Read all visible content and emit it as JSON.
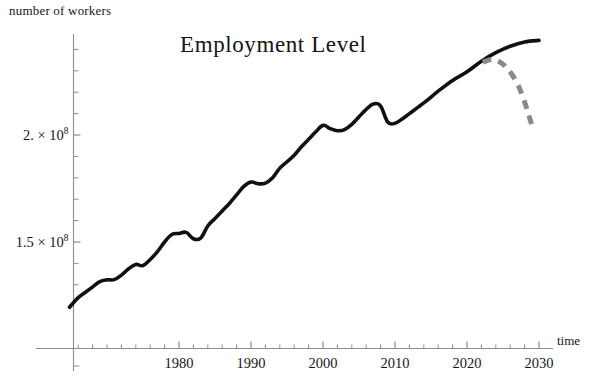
{
  "chart_data": {
    "type": "line",
    "title": "Employment  Level",
    "xlabel": "time",
    "ylabel": "number of workers",
    "xlim": [
      1964.8,
      2032
    ],
    "ylim": [
      121000000,
      248000000
    ],
    "grid": false,
    "legend": "none",
    "xticks": [
      1980,
      1990,
      2000,
      2010,
      2020,
      2030
    ],
    "xtick_labels": [
      "1980",
      "1990",
      "2000",
      "2010",
      "2020",
      "2030"
    ],
    "xminor_step": 2,
    "yticks": [
      150000000,
      200000000
    ],
    "ytick_labels": [
      "1.5 × 10",
      "2. × 10"
    ],
    "ytick_exponent": "8",
    "yminor_step": 10000000,
    "series": [
      {
        "name": "employment-history",
        "style": "solid",
        "color": "#111111",
        "x": [
          1964.8,
          1966,
          1967,
          1968,
          1969,
          1970,
          1971,
          1972,
          1973,
          1974,
          1975,
          1976,
          1977,
          1978,
          1979,
          1980,
          1981,
          1982,
          1983,
          1984,
          1985,
          1986,
          1987,
          1988,
          1989,
          1990,
          1991,
          1992,
          1993,
          1994,
          1995,
          1996,
          1997,
          1998,
          1999,
          2000,
          2001,
          2002,
          2003,
          2004,
          2005,
          2006,
          2007,
          2008,
          2009,
          2010,
          2011,
          2012,
          2014,
          2016,
          2018,
          2020,
          2022,
          2024,
          2026,
          2028,
          2030
        ],
        "y": [
          119500000,
          124000000,
          126500000,
          129000000,
          131500000,
          132300000,
          132400000,
          134500000,
          137500000,
          139500000,
          139000000,
          141800000,
          145500000,
          150000000,
          153500000,
          154000000,
          154500000,
          151500000,
          151800000,
          157500000,
          161000000,
          164500000,
          168000000,
          172000000,
          176000000,
          178000000,
          177200000,
          177500000,
          180000000,
          184500000,
          187500000,
          190500000,
          194500000,
          198000000,
          201500000,
          204500000,
          203000000,
          202000000,
          202500000,
          205000000,
          208500000,
          212000000,
          214500000,
          213500000,
          206000000,
          205500000,
          207500000,
          210000000,
          215000000,
          220500000,
          225500000,
          229500000,
          234500000,
          238500000,
          241500000,
          243500000,
          244200000
        ]
      },
      {
        "name": "employment-forecast-decline",
        "style": "dashed",
        "color": "#8a8a8a",
        "x": [
          2022.2,
          2023.2,
          2024.2,
          2025.2,
          2026.2,
          2027.2,
          2028.0,
          2028.6,
          2029.2
        ],
        "y": [
          234000000,
          235200000,
          234800000,
          232500000,
          228500000,
          222500000,
          215500000,
          209000000,
          202500000
        ]
      }
    ],
    "annotations": [
      {
        "name": "history-curve-label",
        "text": "solid black historical employment curve"
      },
      {
        "name": "forecast-curve-label",
        "text": "gray dashed declining projection"
      }
    ]
  },
  "axes": {
    "y_axis_caption": "number of workers",
    "x_axis_caption": "time"
  },
  "colors": {
    "history": "#111111",
    "forecast": "#8a8a8a",
    "axis": "#8d8d8d",
    "text": "#161616",
    "background": "#ffffff"
  }
}
